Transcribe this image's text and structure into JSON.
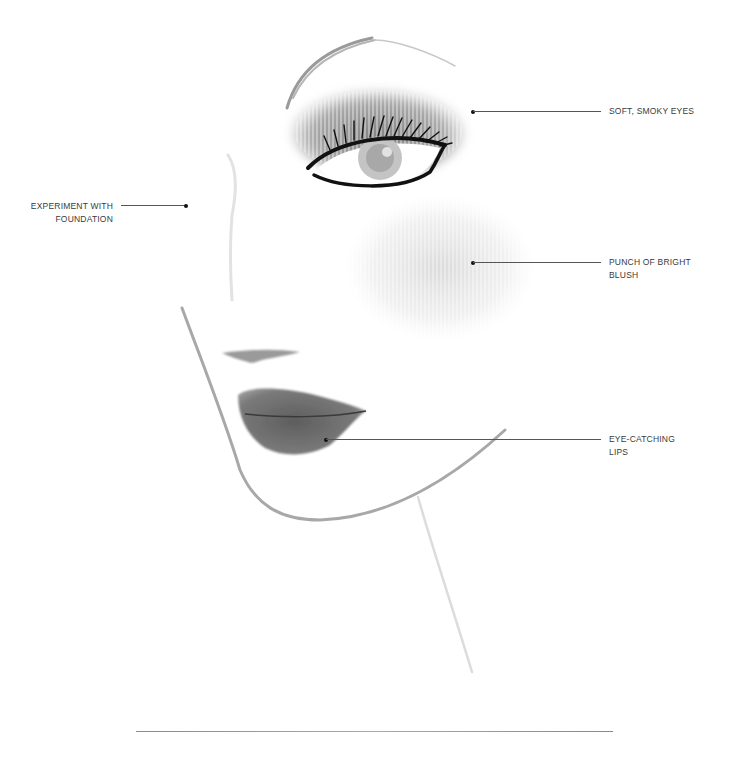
{
  "annotations": [
    {
      "id": "eyes",
      "lines": [
        "SOFT, SMOKY EYES"
      ],
      "side": "right"
    },
    {
      "id": "foundation",
      "lines": [
        "EXPERIMENT WITH",
        "FOUNDATION"
      ],
      "side": "left"
    },
    {
      "id": "blush",
      "lines": [
        "PUNCH OF BRIGHT",
        "BLUSH"
      ],
      "side": "right"
    },
    {
      "id": "lips",
      "lines": [
        "EYE-CATCHING",
        "LIPS"
      ],
      "side": "right"
    }
  ],
  "colors": {
    "background": "#ffffff",
    "text": "#3a3a3a",
    "leader_line": "#555555",
    "dot": "#111111",
    "eyeshadow": "#8c8c8c",
    "lips": "#6e6e6e",
    "face_outline": "#a8a8a8"
  },
  "illustration": {
    "subject": "face-makeup-sketch",
    "features": [
      "eyebrow",
      "smoky-eye",
      "eyeliner",
      "eyelashes",
      "cheek-blush",
      "nose",
      "lips",
      "jawline",
      "neck"
    ]
  }
}
